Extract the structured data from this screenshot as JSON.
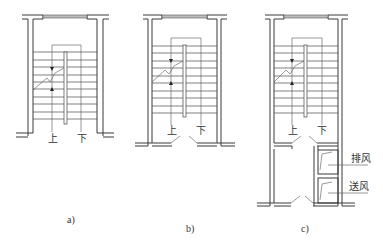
{
  "figure": {
    "panels": [
      {
        "id": "a",
        "caption": "a)",
        "stair_up_label": "上",
        "stair_down_label": "下"
      },
      {
        "id": "b",
        "caption": "b)",
        "stair_up_label": "上",
        "stair_down_label": "下"
      },
      {
        "id": "c",
        "caption": "c)",
        "stair_up_label": "上",
        "stair_down_label": "下",
        "exhaust_label": "排风",
        "supply_label": "送风"
      }
    ]
  }
}
